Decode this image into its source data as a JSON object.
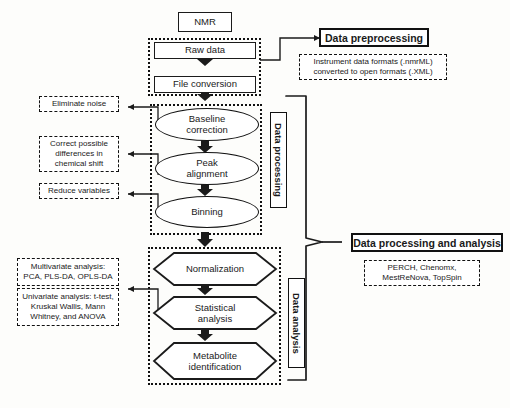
{
  "diagram": {
    "type": "flowchart",
    "start_node": "NMR",
    "nodes": {
      "nmr": "NMR",
      "raw_data": "Raw data",
      "file_conversion": "File conversion",
      "baseline_correction": "Baseline\ncorrection",
      "peak_alignment": "Peak\nalignment",
      "binning": "Binning",
      "normalization": "Normalization",
      "statistical_analysis": "Statistical\nanalysis",
      "metabolite_identification": "Metabolite\nidentification"
    },
    "node_lines": {
      "baseline_correction": [
        "Baseline",
        "correction"
      ],
      "peak_alignment": [
        "Peak",
        "alignment"
      ],
      "statistical_analysis": [
        "Statistical",
        "analysis"
      ],
      "metabolite_identification": [
        "Metabolite",
        "identification"
      ]
    },
    "stage_labels": {
      "data_processing": "Data processing",
      "data_analysis": "Data analysis"
    },
    "headers": {
      "preprocessing": "Data preprocessing",
      "processing_and_analysis": "Data processing and analysis"
    },
    "header_notes": {
      "preprocessing_line1": "Instrument data formats (.nmrML)",
      "preprocessing_line2": "converted to open formats (.XML)",
      "software_line1": "PERCH, Chenomx,",
      "software_line2": "MestReNova, TopSpin"
    },
    "callouts": {
      "eliminate_noise": "Eliminate noise",
      "chemical_shift_line1": "Correct possible",
      "chemical_shift_line2": "differences in",
      "chemical_shift_line3": "chemical shift",
      "reduce_variables": "Reduce variables",
      "multivariate_line1": "Multivariate analysis:",
      "multivariate_line2": "PCA, PLS-DA, OPLS-DA",
      "univariate_line1": "Univariate analysis: t-test,",
      "univariate_line2": "Kruskal Wallis, Mann",
      "univariate_line3": "Whitney, and ANOVA"
    },
    "colors": {
      "stroke": "#1b1b1b",
      "fill": "#ffffff",
      "background": "#fdfdfb"
    }
  }
}
